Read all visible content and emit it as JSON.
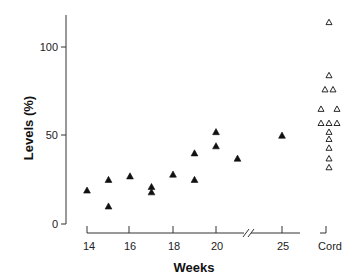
{
  "chart_data": {
    "type": "scatter",
    "title": "",
    "xlabel": "Weeks",
    "ylabel": "Levels (%)",
    "ylim": [
      0,
      120
    ],
    "yticks": [
      0,
      50,
      100
    ],
    "xticks": [
      "14",
      "16",
      "18",
      "20",
      "25",
      "Cord"
    ],
    "axis_break": "between 20 and 25 on x-axis",
    "grid": false,
    "legend": null,
    "series": [
      {
        "name": "Fetal (weeks)",
        "marker": "filled-triangle",
        "points": [
          {
            "x": 14,
            "y": 19
          },
          {
            "x": 15,
            "y": 25
          },
          {
            "x": 15,
            "y": 10
          },
          {
            "x": 16,
            "y": 27
          },
          {
            "x": 17,
            "y": 21
          },
          {
            "x": 17,
            "y": 18
          },
          {
            "x": 18,
            "y": 28
          },
          {
            "x": 19,
            "y": 40
          },
          {
            "x": 19,
            "y": 25
          },
          {
            "x": 20,
            "y": 52
          },
          {
            "x": 20,
            "y": 44
          },
          {
            "x": 21,
            "y": 37
          },
          {
            "x": 25,
            "y": 50
          }
        ]
      },
      {
        "name": "Cord",
        "marker": "open-triangle",
        "points": [
          {
            "x": "Cord",
            "offset": 0,
            "y": 114
          },
          {
            "x": "Cord",
            "offset": 0,
            "y": 84
          },
          {
            "x": "Cord",
            "offset": -1,
            "y": 76
          },
          {
            "x": "Cord",
            "offset": 1,
            "y": 76
          },
          {
            "x": "Cord",
            "offset": -2,
            "y": 65
          },
          {
            "x": "Cord",
            "offset": 2,
            "y": 65
          },
          {
            "x": "Cord",
            "offset": -2,
            "y": 57
          },
          {
            "x": "Cord",
            "offset": 0,
            "y": 57
          },
          {
            "x": "Cord",
            "offset": 2,
            "y": 57
          },
          {
            "x": "Cord",
            "offset": 0,
            "y": 52
          },
          {
            "x": "Cord",
            "offset": 0,
            "y": 48
          },
          {
            "x": "Cord",
            "offset": 0,
            "y": 43
          },
          {
            "x": "Cord",
            "offset": 0,
            "y": 37
          },
          {
            "x": "Cord",
            "offset": 0,
            "y": 32
          }
        ]
      }
    ]
  },
  "labels": {
    "y0": "0",
    "y50": "50",
    "y100": "100",
    "x14": "14",
    "x16": "16",
    "x18": "18",
    "x20": "20",
    "x25": "25",
    "xcord": "Cord",
    "xtitle": "Weeks",
    "ytitle": "Levels (%)"
  }
}
